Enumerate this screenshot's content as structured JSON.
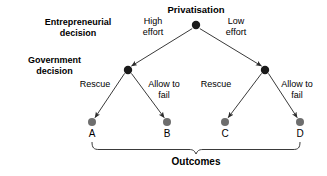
{
  "diagram": {
    "title": "Privatisation",
    "type": "decision-tree",
    "row_labels": [
      {
        "id": "entrepreneurial",
        "text": "Entrepreneurial\ndecision"
      },
      {
        "id": "government",
        "text": "Government\ndecision"
      }
    ],
    "nodes": [
      {
        "id": "root",
        "label": "Privatisation",
        "x": 196,
        "y": 25,
        "r": 4.2,
        "color": "#1a1a1a"
      },
      {
        "id": "left-mid",
        "label": "",
        "x": 128,
        "y": 70,
        "r": 4.2,
        "color": "#1a1a1a"
      },
      {
        "id": "right-mid",
        "label": "",
        "x": 265,
        "y": 70,
        "r": 4.2,
        "color": "#1a1a1a"
      },
      {
        "id": "leaf-a",
        "label": "A",
        "x": 92,
        "y": 122,
        "r": 4.0,
        "color": "#6e6e6e"
      },
      {
        "id": "leaf-b",
        "label": "B",
        "x": 167,
        "y": 122,
        "r": 4.0,
        "color": "#6e6e6e"
      },
      {
        "id": "leaf-c",
        "label": "C",
        "x": 225,
        "y": 122,
        "r": 4.0,
        "color": "#6e6e6e"
      },
      {
        "id": "leaf-d",
        "label": "D",
        "x": 300,
        "y": 122,
        "r": 4.0,
        "color": "#6e6e6e"
      }
    ],
    "edges": [
      {
        "id": "root-to-left",
        "from": "root",
        "to": "left-mid",
        "label": "High\neffort",
        "label_x": 153,
        "label_y": 16
      },
      {
        "id": "root-to-right",
        "from": "root",
        "to": "right-mid",
        "label": "Low\neffort",
        "label_x": 236,
        "label_y": 16
      },
      {
        "id": "left-to-a",
        "from": "left-mid",
        "to": "leaf-a",
        "label": "Rescue",
        "label_x": 95,
        "label_y": 80
      },
      {
        "id": "left-to-b",
        "from": "left-mid",
        "to": "leaf-b",
        "label": "Allow to\nfail",
        "label_x": 164,
        "label_y": 80
      },
      {
        "id": "right-to-c",
        "from": "right-mid",
        "to": "leaf-c",
        "label": "Rescue",
        "label_x": 216,
        "label_y": 80
      },
      {
        "id": "right-to-d",
        "from": "right-mid",
        "to": "leaf-d",
        "label": "Allow to\nfail",
        "label_x": 297,
        "label_y": 80
      }
    ],
    "bracket": {
      "label": "Outcomes",
      "left_x": 92,
      "right_x": 300,
      "center_x": 196
    },
    "colors": {
      "line": "#3a3a3a",
      "internal_node": "#1a1a1a",
      "leaf_node": "#6e6e6e",
      "text": "#000000",
      "background": "#ffffff"
    }
  }
}
